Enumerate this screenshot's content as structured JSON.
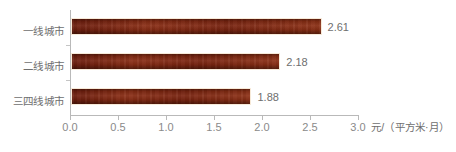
{
  "chart_data": {
    "type": "bar",
    "orientation": "horizontal",
    "title": "",
    "subtitle": "",
    "xlabel": "元/（平方米·月）",
    "ylabel": "",
    "categories": [
      "一线城市",
      "二线城市",
      "三四线城市"
    ],
    "values": [
      2.61,
      2.18,
      1.88
    ],
    "data_labels": [
      "2.61",
      "2.18",
      "1.88"
    ],
    "xlim": [
      0.0,
      3.0
    ],
    "xticks": [
      0.0,
      0.5,
      1.0,
      1.5,
      2.0,
      2.5,
      3.0
    ],
    "xtick_labels": [
      "0.0",
      "0.5",
      "1.0",
      "1.5",
      "2.0",
      "2.5",
      "3.0"
    ],
    "grid": false,
    "legend": null,
    "series": [
      {
        "name": "",
        "values": [
          2.61,
          2.18,
          1.88
        ],
        "color": "#7b2310"
      }
    ],
    "colors": {
      "bar_fill": "#7b2310",
      "bar_border": "#f7ead9",
      "axis_line": "#b9b9b9",
      "tick_label": "#8a8a8a",
      "category_label": "#6e6e6e",
      "value_label": "#6e6e6e",
      "background": "#ffffff"
    }
  }
}
